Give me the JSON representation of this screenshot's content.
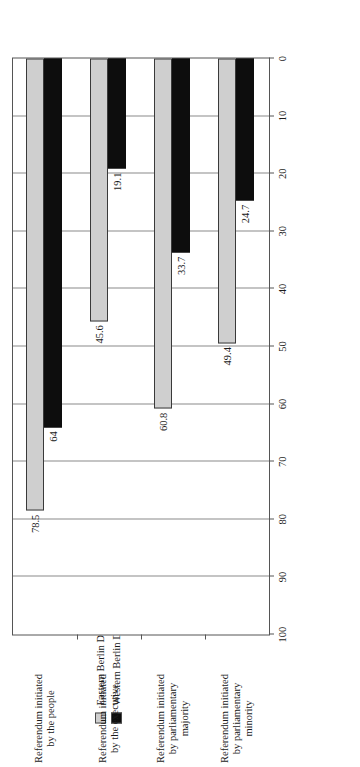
{
  "chart_data": {
    "type": "bar",
    "orientation": "horizontal",
    "title": "",
    "subtitle": "",
    "xlabel": "",
    "ylabel": "% of deputies",
    "value_axis_label": "% of deputies",
    "categories": [
      "Referendum initiated by parliamentary minority",
      "Referendum initiated by parliamentary majority",
      "Referendum initiated by the executive",
      "Referendum initiated by the people"
    ],
    "category_lines": [
      [
        "Referendum initiated",
        "by parliamentary",
        "minority"
      ],
      [
        "Referendum initiated",
        "by parliamentary",
        "majority"
      ],
      [
        "Referendum initiated",
        "by the executive"
      ],
      [
        "Referendum initiated",
        "by the people"
      ]
    ],
    "series": [
      {
        "name": "Eastern Berlin Deputies",
        "color": "#cfcfcf",
        "values": [
          49.4,
          60.8,
          45.6,
          78.5
        ],
        "labels": [
          "49.4",
          "60.8",
          "45.6",
          "78.5"
        ]
      },
      {
        "name": "Western Berlin Deputies",
        "color": "#0d0d0d",
        "values": [
          24.7,
          33.7,
          19.1,
          64
        ],
        "labels": [
          "24.7",
          "33.7",
          "19.1",
          "64"
        ]
      }
    ],
    "value_axis": {
      "min": 0,
      "max": 100,
      "ticks": [
        0,
        10,
        20,
        30,
        40,
        50,
        60,
        70,
        80,
        90,
        100
      ],
      "tick_labels": [
        "0",
        "10",
        "20",
        "30",
        "40",
        "50",
        "60",
        "70",
        "80",
        "90",
        "100"
      ],
      "direction": "reversed",
      "grid": true
    },
    "legend": {
      "position": "top",
      "entries": [
        {
          "label": "Eastern Berlin Deputies",
          "swatch": "#cfcfcf"
        },
        {
          "label": "Western Berlin Deputies",
          "swatch": "#0d0d0d"
        }
      ]
    },
    "colors": {
      "eastern": "#cfcfcf",
      "western": "#0d0d0d",
      "grid": "#8a8a8a",
      "frame": "#555555",
      "text": "#1a1a1a",
      "background": "#ffffff"
    }
  }
}
